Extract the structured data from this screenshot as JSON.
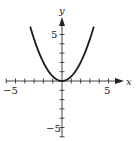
{
  "chart_data": {
    "type": "line",
    "title": "",
    "xlabel": "x",
    "ylabel": "y",
    "function": "y = x^2 / 2",
    "xlim": [
      -6,
      6
    ],
    "ylim": [
      -6,
      6
    ],
    "x_ticks": [
      -6,
      -5,
      -4,
      -3,
      -2,
      -1,
      1,
      2,
      3,
      4,
      5
    ],
    "y_ticks": [
      -6,
      -5,
      -4,
      -3,
      -2,
      -1,
      1,
      2,
      3,
      4,
      5
    ],
    "x_tick_labels": [
      {
        "value": -5,
        "text": "−5"
      },
      {
        "value": 5,
        "text": "5"
      }
    ],
    "y_tick_labels": [
      {
        "value": 5,
        "text": "5"
      },
      {
        "value": -5,
        "text": "−5"
      }
    ],
    "grid": false,
    "series": [
      {
        "name": "parabola",
        "x": [
          -3.4,
          -3,
          -2.5,
          -2,
          -1.5,
          -1,
          -0.5,
          0,
          0.5,
          1,
          1.5,
          2,
          2.5,
          3,
          3.4
        ],
        "y": [
          5.78,
          4.5,
          3.125,
          2,
          1.125,
          0.5,
          0.125,
          0,
          0.125,
          0.5,
          1.125,
          2,
          3.125,
          4.5,
          5.78
        ],
        "color": "#1a1a1a"
      }
    ]
  },
  "labels": {
    "x_axis": "x",
    "y_axis": "y",
    "x_neg5": "−5",
    "x_pos5": "5",
    "y_pos5": "5",
    "y_neg5": "−5"
  }
}
